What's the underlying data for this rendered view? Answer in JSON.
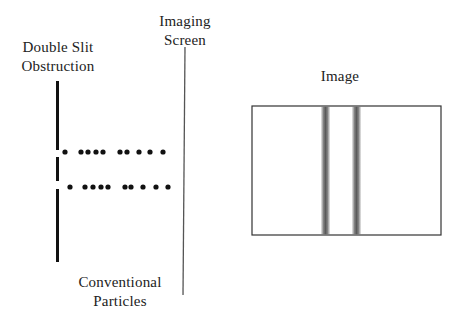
{
  "labels": {
    "slit_line1": "Double Slit",
    "slit_line2": "Obstruction",
    "screen_line1": "Imaging",
    "screen_line2": "Screen",
    "image": "Image",
    "particles_line1": "Conventional",
    "particles_line2": "Particles"
  },
  "diagram": {
    "obstruction": {
      "x": 57.5,
      "width": 3,
      "segments": [
        [
          81,
          150
        ],
        [
          157,
          181
        ],
        [
          189,
          262
        ]
      ],
      "color": "#111111"
    },
    "screen_line": {
      "x1": 185,
      "y1": 47,
      "x2": 183,
      "y2": 295,
      "color": "#555555"
    },
    "particle_rows": [
      {
        "y": 152,
        "xs": [
          65,
          81,
          88,
          96,
          103,
          120,
          127,
          139,
          150,
          163
        ]
      },
      {
        "y": 187,
        "xs": [
          70,
          85,
          93,
          101,
          108,
          125,
          131,
          143,
          156,
          168
        ]
      }
    ],
    "particle_radius": 2.6,
    "particle_color": "#111111",
    "image_box": {
      "x": 252,
      "y": 106,
      "width": 189,
      "height": 129,
      "stroke": "#333333"
    },
    "bands": [
      {
        "center_x": 325.5,
        "width": 10
      },
      {
        "center_x": 356.5,
        "width": 10
      }
    ],
    "band_color": "#6a6a6a"
  }
}
